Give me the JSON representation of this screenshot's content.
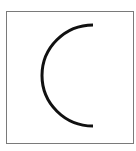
{
  "figure": {
    "description": "Left semicircle arc inside a square frame",
    "frame_color": "#7a7a7a",
    "arc": {
      "color": "#111111",
      "stroke_width": 3,
      "center": [
        93,
        75.5
      ],
      "radius": 51,
      "direction": "opens-right"
    }
  }
}
